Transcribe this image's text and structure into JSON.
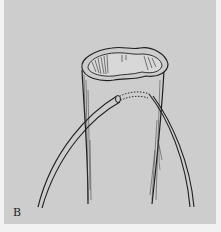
{
  "figure": {
    "panel_label": "B",
    "colors": {
      "background": "#cdcdcd",
      "ink": "#1e1e1e",
      "border": "#f2f2f2"
    }
  }
}
